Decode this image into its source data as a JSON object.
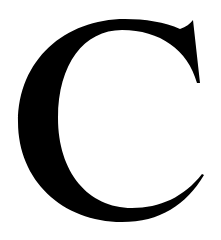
{
  "glyph": {
    "character": "C",
    "style": "serif capital letter",
    "fill_color": "#000000",
    "background_color": "#ffffff"
  }
}
